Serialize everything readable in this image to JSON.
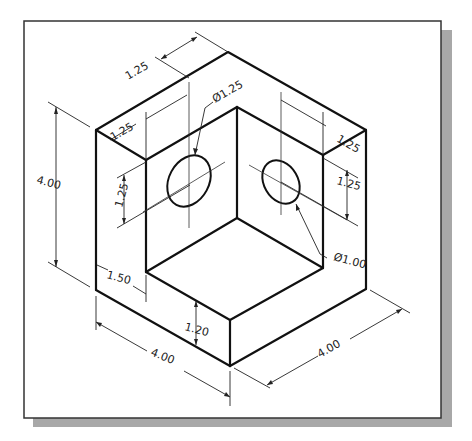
{
  "figure": {
    "type": "isometric technical drawing",
    "colors": {
      "line": "#111111",
      "frame": "#333333",
      "shadow": "#a8a8a8",
      "background": "#ffffff"
    }
  },
  "dimensions": {
    "top_depth": "1.25",
    "left_wall_thickness": "1.25",
    "right_wall_thickness": "1.25",
    "left_hole_height": "1.25",
    "right_hole_height": "1.25",
    "left_hole_diameter": "Ø1.25",
    "right_hole_diameter": "Ø1.00",
    "overall_height": "4.00",
    "step_width": "1.50",
    "base_height": "1.20",
    "front_width": "4.00",
    "side_depth": "4.00"
  }
}
